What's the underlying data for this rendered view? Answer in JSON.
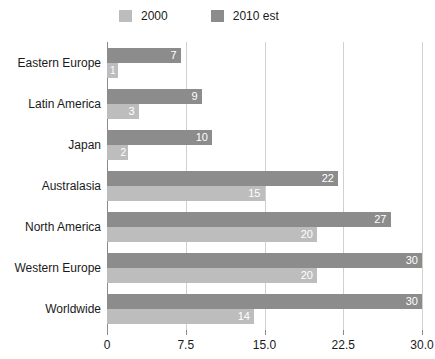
{
  "chart_data": {
    "type": "bar",
    "orientation": "horizontal",
    "title": "",
    "xlabel": "",
    "ylabel": "",
    "xlim": [
      0,
      30
    ],
    "xticks": [
      "0",
      "7.5",
      "15.0",
      "22.5",
      "30.0"
    ],
    "xtick_values": [
      0,
      7.5,
      15,
      22.5,
      30
    ],
    "grid": "vertical",
    "legend_position": "top",
    "categories": [
      "Eastern Europe",
      "Latin America",
      "Japan",
      "Australasia",
      "North America",
      "Western Europe",
      "Worldwide"
    ],
    "series": [
      {
        "name": "2000",
        "color": "#bdbdbd",
        "values": [
          1,
          3,
          2,
          15,
          20,
          20,
          14
        ],
        "labels": [
          "1",
          "3",
          "2",
          "15",
          "20",
          "20",
          "14"
        ]
      },
      {
        "name": "2010 est",
        "color": "#8c8c8c",
        "values": [
          7,
          9,
          10,
          22,
          27,
          30,
          30
        ],
        "labels": [
          "7",
          "9",
          "10",
          "22",
          "27",
          "30",
          "30"
        ]
      }
    ]
  },
  "legend": {
    "items": [
      {
        "label": "2000",
        "color": "#bdbdbd"
      },
      {
        "label": "2010 est",
        "color": "#8c8c8c"
      }
    ]
  },
  "axis": {
    "tick_labels": [
      "0",
      "7.5",
      "15.0",
      "22.5",
      "30.0"
    ]
  },
  "colors": {
    "series_2000": "#bdbdbd",
    "series_2010": "#8c8c8c",
    "gridline": "#d0d0d0",
    "axis": "#8a8a8a",
    "text": "#1a1a1a",
    "value_label": "#ffffff",
    "background": "#ffffff"
  }
}
